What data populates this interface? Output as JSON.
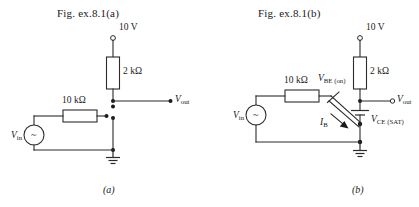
{
  "figure": {
    "panel_a": {
      "title": "Fig. ex.8.1(a)",
      "caption": "(a)",
      "supply_label": "10 V",
      "collector_resistor": "2 kΩ",
      "base_resistor": "10 kΩ",
      "source_label_v": "V",
      "source_label_sub": "in",
      "source_symbol": "~",
      "output_label_v": "V",
      "output_label_sub": "out"
    },
    "panel_b": {
      "title": "Fig. ex.8.1(b)",
      "caption": "(b)",
      "supply_label": "10 V",
      "collector_resistor": "2 kΩ",
      "base_resistor": "10 kΩ",
      "source_label_v": "V",
      "source_label_sub": "in",
      "source_symbol": "~",
      "output_label_v": "V",
      "output_label_sub": "out",
      "vbe_label_v": "V",
      "vbe_label_sub": "BE (on)",
      "vce_label_v": "V",
      "vce_label_sub": "CE (SAT)",
      "base_current_label_i": "I",
      "base_current_label_sub": "B"
    }
  },
  "colors": {
    "ink": "#1a1a1a",
    "wire": "#2b2b2b",
    "background": "#ffffff"
  }
}
